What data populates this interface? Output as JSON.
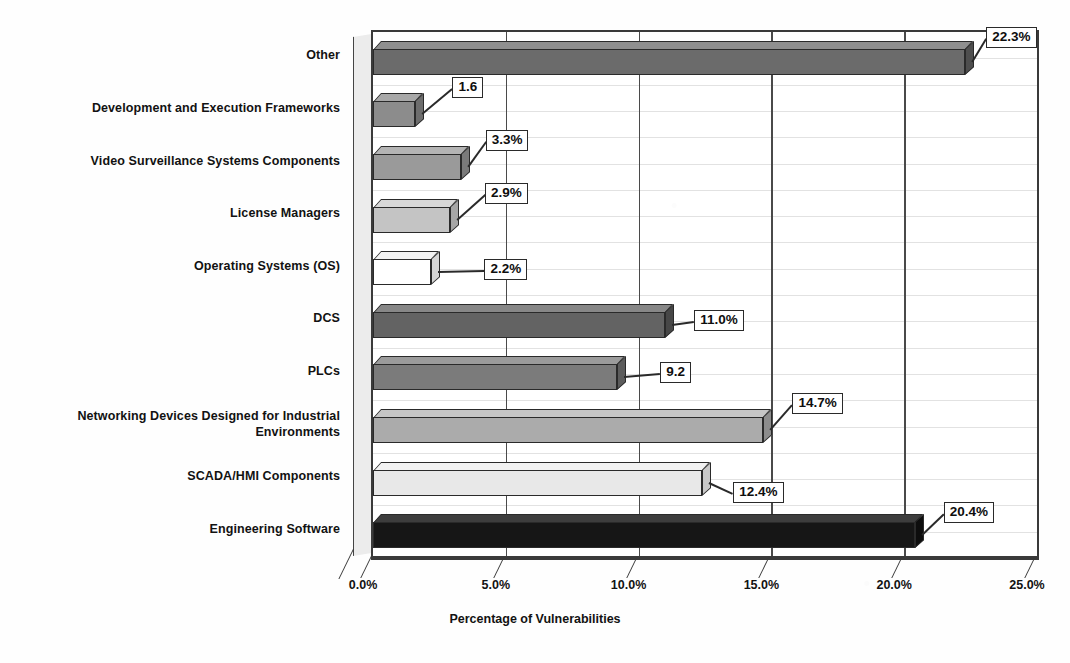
{
  "chart_data": {
    "type": "bar",
    "orientation": "horizontal",
    "title": "",
    "xlabel": "Percentage of Vulnerabilities",
    "ylabel": "",
    "xlim": [
      0,
      25
    ],
    "xticks": [
      "0.0%",
      "5.0%",
      "10.0%",
      "15.0%",
      "20.0%",
      "25.0%"
    ],
    "xtick_values": [
      0,
      5,
      10,
      15,
      20,
      25
    ],
    "grid": "vertical",
    "legend": "none",
    "categories": [
      "Other",
      "Development and Execution Frameworks",
      "Video Surveillance Systems Components",
      "License Managers",
      "Operating Systems (OS)",
      "DCS",
      "PLCs",
      "Networking Devices Designed for Industrial Environments",
      "SCADA/HMI Components",
      "Engineering Software"
    ],
    "values": [
      22.3,
      1.6,
      3.3,
      2.9,
      2.2,
      11.0,
      9.2,
      14.7,
      12.4,
      20.4
    ],
    "data_labels": [
      "22.3%",
      "1.6",
      "3.3%",
      "2.9%",
      "2.2%",
      "11.0%",
      "9.2",
      "14.7%",
      "12.4%",
      "20.4%"
    ],
    "bar_colors": [
      "#6b6b6b",
      "#8c8c8c",
      "#9a9a9a",
      "#c4c4c4",
      "#ffffff",
      "#636363",
      "#7b7b7b",
      "#ababab",
      "#e8e8e8",
      "#161616"
    ],
    "bar_top_colors": [
      "#8f8f8f",
      "#a8a8a8",
      "#b4b4b4",
      "#d8d8d8",
      "#f2f2f2",
      "#878787",
      "#9b9b9b",
      "#c6c6c6",
      "#f2f2f2",
      "#3d3d3d"
    ],
    "bar_side_colors": [
      "#4e4e4e",
      "#6d6d6d",
      "#7a7a7a",
      "#a6a6a6",
      "#d5d5d5",
      "#474747",
      "#5c5c5c",
      "#8c8c8c",
      "#c9c9c9",
      "#0d0d0d"
    ]
  },
  "axis": {
    "x_title": "Percentage of Vulnerabilities"
  },
  "colors": {
    "frame": "#3a3a3a",
    "gridline": "#4a4a4a",
    "text": "#121212",
    "background": "#fefefe"
  }
}
